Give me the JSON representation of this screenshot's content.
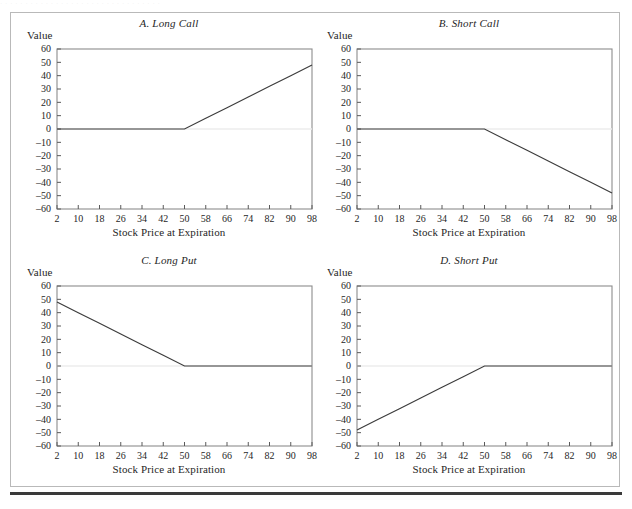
{
  "figure": {
    "scan_artifact": "· · · · · · · · · · · · · · · · · · · · · · · · · · · · · · · ·",
    "border_color": "#b9b9b9",
    "rule_color": "#3a3a3a",
    "background": "#ffffff"
  },
  "common": {
    "y_axis_label": "Value",
    "x_axis_label": "Stock Price at Expiration",
    "y_ticks": [
      "60",
      "50",
      "40",
      "30",
      "20",
      "10",
      "0",
      "–10",
      "–20",
      "–30",
      "–40",
      "–50",
      "–60"
    ],
    "x_ticks": [
      "2",
      "10",
      "18",
      "26",
      "34",
      "42",
      "50",
      "58",
      "66",
      "74",
      "82",
      "90",
      "98"
    ],
    "line_color": "#3c3c3c",
    "axis_color": "#8c8c8c",
    "zero_line_color": "#ededed"
  },
  "panels": [
    {
      "id": "A",
      "title": "A. Long Call",
      "y_axis_label": "Value",
      "x_axis_label": "Stock Price at Expiration"
    },
    {
      "id": "B",
      "title": "B. Short Call",
      "y_axis_label": "Value",
      "x_axis_label": "Stock Price at Expiration"
    },
    {
      "id": "C",
      "title": "C. Long Put",
      "y_axis_label": "Value",
      "x_axis_label": "Stock Price at Expiration"
    },
    {
      "id": "D",
      "title": "D. Short Put",
      "y_axis_label": "Value",
      "x_axis_label": "Stock Price at Expiration"
    }
  ],
  "chart_data": [
    {
      "type": "line",
      "title": "A. Long Call",
      "xlabel": "Stock Price at Expiration",
      "ylabel": "Value",
      "xlim": [
        2,
        98
      ],
      "ylim": [
        -60,
        60
      ],
      "xticks": [
        2,
        10,
        18,
        26,
        34,
        42,
        50,
        58,
        66,
        74,
        82,
        90,
        98
      ],
      "yticks": [
        -60,
        -50,
        -40,
        -30,
        -20,
        -10,
        0,
        10,
        20,
        30,
        40,
        50,
        60
      ],
      "grid": false,
      "legend": "none",
      "strike": 50,
      "series": [
        {
          "name": "Long Call payoff",
          "x": [
            2,
            10,
            18,
            26,
            34,
            42,
            50,
            58,
            66,
            74,
            82,
            90,
            98
          ],
          "values": [
            0,
            0,
            0,
            0,
            0,
            0,
            0,
            8,
            16,
            24,
            32,
            40,
            48
          ]
        }
      ]
    },
    {
      "type": "line",
      "title": "B. Short Call",
      "xlabel": "Stock Price at Expiration",
      "ylabel": "Value",
      "xlim": [
        2,
        98
      ],
      "ylim": [
        -60,
        60
      ],
      "xticks": [
        2,
        10,
        18,
        26,
        34,
        42,
        50,
        58,
        66,
        74,
        82,
        90,
        98
      ],
      "yticks": [
        -60,
        -50,
        -40,
        -30,
        -20,
        -10,
        0,
        10,
        20,
        30,
        40,
        50,
        60
      ],
      "grid": false,
      "legend": "none",
      "strike": 50,
      "series": [
        {
          "name": "Short Call payoff",
          "x": [
            2,
            10,
            18,
            26,
            34,
            42,
            50,
            58,
            66,
            74,
            82,
            90,
            98
          ],
          "values": [
            0,
            0,
            0,
            0,
            0,
            0,
            0,
            -8,
            -16,
            -24,
            -32,
            -40,
            -48
          ]
        }
      ]
    },
    {
      "type": "line",
      "title": "C. Long Put",
      "xlabel": "Stock Price at Expiration",
      "ylabel": "Value",
      "xlim": [
        2,
        98
      ],
      "ylim": [
        -60,
        60
      ],
      "xticks": [
        2,
        10,
        18,
        26,
        34,
        42,
        50,
        58,
        66,
        74,
        82,
        90,
        98
      ],
      "yticks": [
        -60,
        -50,
        -40,
        -30,
        -20,
        -10,
        0,
        10,
        20,
        30,
        40,
        50,
        60
      ],
      "grid": false,
      "legend": "none",
      "strike": 50,
      "series": [
        {
          "name": "Long Put payoff",
          "x": [
            2,
            10,
            18,
            26,
            34,
            42,
            50,
            58,
            66,
            74,
            82,
            90,
            98
          ],
          "values": [
            48,
            40,
            32,
            24,
            16,
            8,
            0,
            0,
            0,
            0,
            0,
            0,
            0
          ]
        }
      ]
    },
    {
      "type": "line",
      "title": "D. Short Put",
      "xlabel": "Stock Price at Expiration",
      "ylabel": "Value",
      "xlim": [
        2,
        98
      ],
      "ylim": [
        -60,
        60
      ],
      "xticks": [
        2,
        10,
        18,
        26,
        34,
        42,
        50,
        58,
        66,
        74,
        82,
        90,
        98
      ],
      "yticks": [
        -60,
        -50,
        -40,
        -30,
        -20,
        -10,
        0,
        10,
        20,
        30,
        40,
        50,
        60
      ],
      "grid": false,
      "legend": "none",
      "strike": 50,
      "series": [
        {
          "name": "Short Put payoff",
          "x": [
            2,
            10,
            18,
            26,
            34,
            42,
            50,
            58,
            66,
            74,
            82,
            90,
            98
          ],
          "values": [
            -48,
            -40,
            -32,
            -24,
            -16,
            -8,
            0,
            0,
            0,
            0,
            0,
            0,
            0
          ]
        }
      ]
    }
  ]
}
